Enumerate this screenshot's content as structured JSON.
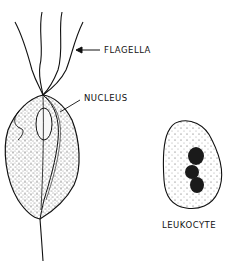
{
  "figure": {
    "labels": {
      "flagella": "FLAGELLA",
      "nucleus": "NUCLEUS",
      "leukocyte": "LEUKOCYTE"
    },
    "colors": {
      "ink": "#111111",
      "background": "#ffffff"
    }
  }
}
